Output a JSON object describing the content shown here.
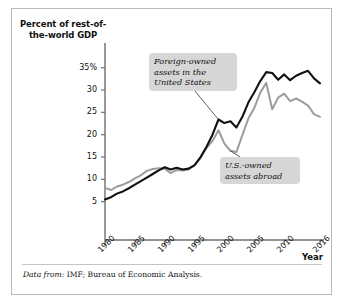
{
  "figure": {
    "y_axis_title": "Percent of rest-of-the-world GDP",
    "x_axis_title": "Year",
    "source_prefix": "Data from:",
    "source_text": "IMF; Bureau of Economic Analysis.",
    "colors": {
      "series_foreign": "#111111",
      "series_us": "#9d9d9d",
      "callout_background": "#d6d6d6",
      "frame_border": "#b9b9b9",
      "axis": "#6f6f6f"
    }
  },
  "chart_data": {
    "type": "line",
    "title": "",
    "xlabel": "Year",
    "ylabel": "Percent of rest-of-the-world GDP",
    "xlim": [
      1980,
      2016
    ],
    "ylim": [
      0,
      36.5
    ],
    "yticks": [
      5,
      10,
      15,
      20,
      25,
      30,
      35
    ],
    "ytick_labels": [
      "5",
      "10",
      "15",
      "20",
      "25",
      "30",
      "35%"
    ],
    "xticks": [
      1980,
      1985,
      1990,
      1995,
      2000,
      2005,
      2010,
      2016
    ],
    "xtick_labels": [
      "1980",
      "1985",
      "1990",
      "1995",
      "2000",
      "2005",
      "2010",
      "2016"
    ],
    "grid": false,
    "legend": "annotations",
    "annotations": [
      {
        "label": "Foreign-owned assets in the United States",
        "series": "Foreign-owned assets in the United States",
        "points_to_year": 1999
      },
      {
        "label": "U.S.-owned assets abroad",
        "series": "U.S.-owned assets abroad",
        "points_to_year": 2001
      }
    ],
    "x": [
      1980,
      1981,
      1982,
      1983,
      1984,
      1985,
      1986,
      1987,
      1988,
      1989,
      1990,
      1991,
      1992,
      1993,
      1994,
      1995,
      1996,
      1997,
      1998,
      1999,
      2000,
      2001,
      2002,
      2003,
      2004,
      2005,
      2006,
      2007,
      2008,
      2009,
      2010,
      2011,
      2012,
      2013,
      2014,
      2015,
      2016
    ],
    "series": [
      {
        "name": "Foreign-owned assets in the United States",
        "color": "#111111",
        "values": [
          5.5,
          6.0,
          6.8,
          7.3,
          8.0,
          8.8,
          9.6,
          10.4,
          11.2,
          12.0,
          12.7,
          12.2,
          12.6,
          12.2,
          12.4,
          13.2,
          15.0,
          17.3,
          20.0,
          23.4,
          22.6,
          23.0,
          21.6,
          24.0,
          27.2,
          29.5,
          32.0,
          34.0,
          33.8,
          32.3,
          33.5,
          32.2,
          33.2,
          33.8,
          34.3,
          32.6,
          31.5
        ]
      },
      {
        "name": "U.S.-owned assets abroad",
        "color": "#9d9d9d",
        "values": [
          8.1,
          7.6,
          8.4,
          8.8,
          9.4,
          10.2,
          10.9,
          11.9,
          12.3,
          12.5,
          12.4,
          11.4,
          12.1,
          12.0,
          12.2,
          13.1,
          14.8,
          17.0,
          18.6,
          21.0,
          18.0,
          16.4,
          16.1,
          19.9,
          23.6,
          26.0,
          29.4,
          31.6,
          25.7,
          28.3,
          29.2,
          27.5,
          28.1,
          27.4,
          26.5,
          24.6,
          24.0
        ]
      }
    ]
  }
}
